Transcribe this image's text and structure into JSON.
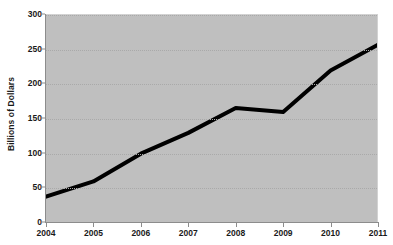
{
  "chart_data": {
    "type": "line",
    "title": "",
    "subtitle": "",
    "xlabel": "",
    "ylabel": "Billions of Dollars",
    "categories": [
      "2004",
      "2005",
      "2006",
      "2007",
      "2008",
      "2009",
      "2010",
      "2011"
    ],
    "values": [
      38,
      60,
      100,
      130,
      166,
      160,
      220,
      257
    ],
    "series": [
      {
        "name": "Billions of Dollars",
        "values": [
          38,
          60,
          100,
          130,
          166,
          160,
          220,
          257
        ]
      }
    ],
    "ylim": [
      0,
      300
    ],
    "ytick_labels": [
      "0",
      "50",
      "100",
      "150",
      "200",
      "250",
      "300"
    ],
    "ytick_values": [
      0,
      50,
      100,
      150,
      200,
      250,
      300
    ],
    "xtick_labels": [
      "2004",
      "2005",
      "2006",
      "2007",
      "2008",
      "2009",
      "2010",
      "2011"
    ],
    "grid": true,
    "grid_style": "dotted",
    "legend": false,
    "legend_position": "none",
    "markers": false,
    "annotations": [],
    "colors": {
      "line": "#000000",
      "plot_background": "#bfbfbf",
      "page_background": "#ffffff",
      "gridline": "#a9a9a9",
      "axis": "#8c8c8c",
      "text": "#1a1a1a"
    },
    "line_width_px": 4
  }
}
